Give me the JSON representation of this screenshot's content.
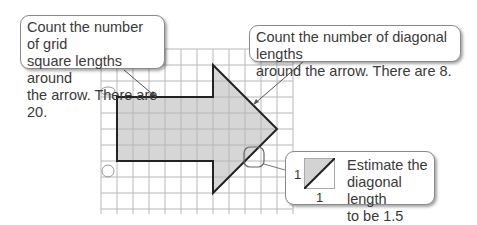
{
  "callouts": {
    "grid_lengths": {
      "lines": [
        "Count the number of grid",
        "square lengths around",
        "the arrow.  There are 20."
      ]
    },
    "diagonal_lengths": {
      "lines": [
        "Count the number of diagonal lengths",
        "around the arrow.  There are 8."
      ]
    },
    "estimate": {
      "lines": [
        "Estimate the",
        "diagonal length",
        "to be 1.5 units."
      ],
      "side_label_vertical": "1",
      "side_label_horizontal": "1"
    }
  },
  "figure": {
    "shape": "arrow",
    "grid_square_lengths": 20,
    "diagonal_lengths": 8,
    "diagonal_estimate_units": 1.5,
    "colors": {
      "fill": "#d3d3d3",
      "outline": "#222222",
      "grid": "#b5b5b5"
    }
  }
}
